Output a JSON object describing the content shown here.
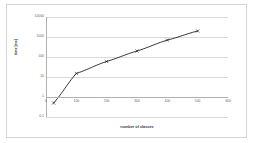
{
  "chart_data": {
    "type": "line",
    "title": "",
    "xlabel": "number of classes",
    "ylabel": "time [ms]",
    "xlim": [
      0,
      600
    ],
    "ylim": [
      0.1,
      10000
    ],
    "yscale": "log",
    "xscale": "linear",
    "grid": true,
    "legend": false,
    "xticks": [
      0,
      100,
      200,
      300,
      400,
      500,
      600
    ],
    "xtick_labels": [
      "0",
      "100",
      "200",
      "300",
      "400",
      "500",
      "600"
    ],
    "yticks": [
      0.1,
      1,
      10,
      100,
      1000,
      10000
    ],
    "ytick_labels": [
      "0.1",
      "1",
      "10",
      "100",
      "1000",
      "10000"
    ],
    "series": [
      {
        "name": "time",
        "marker": "x",
        "color": "#1a1a1a",
        "x": [
          25,
          100,
          200,
          300,
          400,
          500
        ],
        "y": [
          0.5,
          15,
          60,
          200,
          700,
          2000
        ]
      }
    ]
  },
  "axis": {
    "x_title": "number of classes",
    "y_title": "time [ms]"
  },
  "colors": {
    "line": "#1a1a1a",
    "grid": "#d9d9d9",
    "axis": "#b0b0b0",
    "frame": "#d4d4d4",
    "tick_text": "#666666",
    "title_text": "#333333",
    "background": "#ffffff"
  }
}
